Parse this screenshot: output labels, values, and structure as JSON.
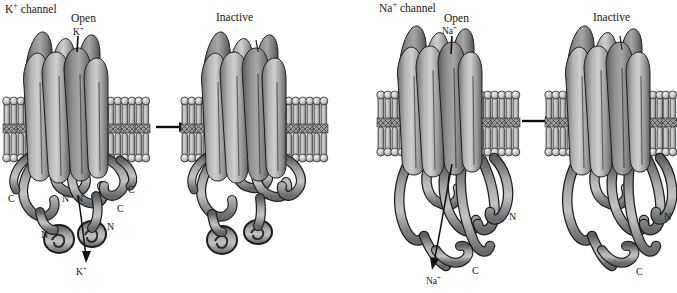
{
  "figure": {
    "title_left": "K+ channel",
    "title_right": "Na+ channel",
    "background_color": "#ffffff",
    "protein_color": "#8c8c8c",
    "membrane_color": "#b9b9b9",
    "outline_color": "#1a1a1a"
  },
  "panels": [
    {
      "id": "k-open",
      "channel": "K",
      "channel_label": "K+ channel",
      "state_label": "Open",
      "ion_label_top": "K+",
      "ion_label_bottom": "K+",
      "terminals": [
        {
          "text": "C",
          "x": 11,
          "y": 200
        },
        {
          "text": "N",
          "x": 64,
          "y": 200
        },
        {
          "text": "N",
          "x": 78,
          "y": 200
        },
        {
          "text": "N",
          "x": 44,
          "y": 236
        },
        {
          "text": "C",
          "x": 131,
          "y": 191
        },
        {
          "text": "C",
          "x": 120,
          "y": 210
        },
        {
          "text": "N",
          "x": 110,
          "y": 228
        }
      ]
    },
    {
      "id": "k-inactive",
      "channel": "K",
      "state_label": "Inactive",
      "terminals": []
    },
    {
      "id": "na-open",
      "channel": "Na",
      "channel_label": "Na+ channel",
      "state_label": "Open",
      "ion_label_top": "Na+",
      "ion_label_bottom": "Na+",
      "terminals": [
        {
          "text": "N",
          "x": 512,
          "y": 218
        },
        {
          "text": "C",
          "x": 475,
          "y": 272
        }
      ]
    },
    {
      "id": "na-inactive",
      "channel": "Na",
      "state_label": "Inactive",
      "terminals": [
        {
          "text": "N",
          "x": 667,
          "y": 218
        },
        {
          "text": "C",
          "x": 639,
          "y": 273
        }
      ]
    }
  ],
  "labels": {
    "k_channel": {
      "base": "K",
      "sup": "+",
      "rest": " channel",
      "x": 5,
      "y": 6
    },
    "na_channel": {
      "base": "Na",
      "sup": "+",
      "rest": " channel",
      "x": 379,
      "y": 5
    },
    "open_left": {
      "text": "Open",
      "x": 71,
      "y": 14
    },
    "inactive_left": {
      "text": "Inactive",
      "x": 216,
      "y": 13
    },
    "open_right": {
      "text": "Open",
      "x": 444,
      "y": 14
    },
    "inactive_right": {
      "text": "Inactive",
      "x": 593,
      "y": 13
    },
    "k_ion_top": {
      "base": "K",
      "sup": "+",
      "x": 76,
      "y": 32
    },
    "k_ion_bottom": {
      "base": "K",
      "sup": "+",
      "x": 78,
      "y": 271
    },
    "na_ion_top": {
      "base": "Na",
      "sup": "+",
      "x": 444,
      "y": 31
    },
    "na_ion_bottom": {
      "base": "Na",
      "sup": "+",
      "x": 428,
      "y": 280
    }
  },
  "arrows": {
    "transition_left": {
      "from_x": 155,
      "from_y": 127,
      "to_x": 188,
      "to_y": 127
    },
    "transition_right": {
      "from_x": 521,
      "from_y": 121,
      "to_x": 554,
      "to_y": 121
    },
    "ion_flux_k": {
      "from_x": 78,
      "from_y": 196,
      "to_x": 86,
      "to_y": 259
    },
    "ion_flux_na": {
      "from_x": 452,
      "from_y": 165,
      "to_x": 434,
      "to_y": 268
    },
    "pore_k": {
      "from_x": 78,
      "from_y": 36,
      "to_x": 77,
      "to_y": 50
    },
    "pore_na": {
      "from_x": 452,
      "from_y": 36,
      "to_x": 451,
      "to_y": 52
    }
  }
}
